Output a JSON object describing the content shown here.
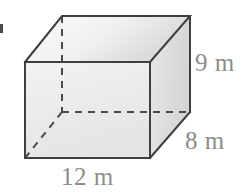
{
  "figure": {
    "type": "rectangular-prism-diagram",
    "shape_name": "rectangular prism",
    "unit": "m",
    "labels": {
      "height": "9 m",
      "depth": "8 m",
      "width": "12 m"
    },
    "dimensions": {
      "height_value": 9,
      "depth_value": 8,
      "width_value": 12
    },
    "colors": {
      "edge_solid": "#3f3f3f",
      "edge_hidden": "#4a4a4a",
      "face_front": "#ececec",
      "face_top": "#f2f2f2",
      "face_right": "#e0e0e0",
      "label_text": "#8c8c8c",
      "background": "#ffffff"
    },
    "geometry": {
      "front_face": [
        [
          25,
          62
        ],
        [
          150,
          62
        ],
        [
          150,
          158
        ],
        [
          25,
          158
        ]
      ],
      "back_face": [
        [
          62,
          16
        ],
        [
          190,
          16
        ],
        [
          190,
          112
        ],
        [
          62,
          112
        ]
      ],
      "hidden_edges": [
        [
          [
            62,
            16
          ],
          [
            62,
            112
          ]
        ],
        [
          [
            62,
            112
          ],
          [
            190,
            112
          ]
        ],
        [
          [
            25,
            158
          ],
          [
            62,
            112
          ]
        ]
      ]
    }
  }
}
